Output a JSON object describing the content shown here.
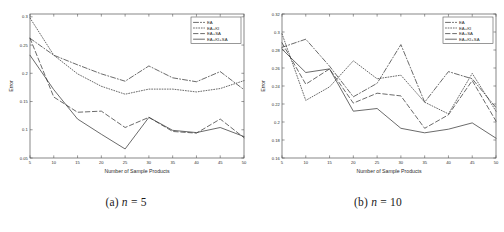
{
  "figure": {
    "subfigures": [
      {
        "caption_prefix": "(a)",
        "caption_var": "n",
        "caption_eq": "=",
        "caption_value": "5",
        "caption_full": "(a) n = 5"
      },
      {
        "caption_prefix": "(b)",
        "caption_var": "n",
        "caption_eq": "=",
        "caption_value": "10",
        "caption_full": "(b) n = 10"
      }
    ]
  },
  "chart_data": [
    {
      "type": "line",
      "title": "",
      "xlabel": "Number of Sample Products",
      "ylabel": "Error",
      "x": [
        5,
        10,
        15,
        20,
        25,
        30,
        35,
        40,
        45,
        50
      ],
      "xlim": [
        5,
        50
      ],
      "ylim": [
        0.05,
        0.305
      ],
      "xticks": [
        5,
        10,
        15,
        20,
        25,
        30,
        35,
        40,
        45,
        50
      ],
      "xticklabels": [
        "5",
        "10",
        "15",
        "20",
        "25",
        "30",
        "35",
        "40",
        "45",
        "50"
      ],
      "yticks": [
        0.05,
        0.1,
        0.15,
        0.2,
        0.25,
        0.3
      ],
      "yticklabels": [
        "0.05",
        "0.1",
        "0.15",
        "0.2",
        "0.25",
        "0.3"
      ],
      "grid": false,
      "legend_position": "upper right",
      "series": [
        {
          "name": "EA",
          "style": "dashdot",
          "values": [
            0.262,
            0.232,
            0.215,
            0.199,
            0.186,
            0.213,
            0.192,
            0.185,
            0.203,
            0.171
          ]
        },
        {
          "name": "EA+KI",
          "style": "dotted",
          "values": [
            0.298,
            0.232,
            0.199,
            0.177,
            0.163,
            0.172,
            0.172,
            0.167,
            0.173,
            0.187
          ]
        },
        {
          "name": "EA+SA",
          "style": "dashed",
          "values": [
            0.262,
            0.158,
            0.131,
            0.133,
            0.104,
            0.122,
            0.097,
            0.094,
            0.119,
            0.086
          ]
        },
        {
          "name": "EA+KI+SA",
          "style": "solid",
          "values": [
            0.232,
            0.171,
            0.119,
            0.092,
            0.066,
            0.122,
            0.099,
            0.095,
            0.104,
            0.088
          ]
        }
      ]
    },
    {
      "type": "line",
      "title": "",
      "xlabel": "Number of Sample Products",
      "ylabel": "Error",
      "x": [
        5,
        10,
        15,
        20,
        25,
        30,
        35,
        40,
        45,
        50
      ],
      "xlim": [
        5,
        50
      ],
      "ylim": [
        0.16,
        0.32
      ],
      "xticks": [
        5,
        10,
        15,
        20,
        25,
        30,
        35,
        40,
        45,
        50
      ],
      "xticklabels": [
        "5",
        "10",
        "15",
        "20",
        "25",
        "30",
        "35",
        "40",
        "45",
        "50"
      ],
      "yticks": [
        0.16,
        0.18,
        0.2,
        0.22,
        0.24,
        0.26,
        0.28,
        0.3,
        0.32
      ],
      "yticklabels": [
        "0.16",
        "0.18",
        "0.2",
        "0.22",
        "0.24",
        "0.26",
        "0.28",
        "0.3",
        "0.32"
      ],
      "grid": false,
      "legend_position": "upper right",
      "series": [
        {
          "name": "EA",
          "style": "dashdot",
          "values": [
            0.283,
            0.292,
            0.262,
            0.228,
            0.243,
            0.286,
            0.222,
            0.256,
            0.248,
            0.216
          ]
        },
        {
          "name": "EA+KI",
          "style": "dotted",
          "values": [
            0.298,
            0.224,
            0.239,
            0.268,
            0.248,
            0.252,
            0.222,
            0.209,
            0.254,
            0.212
          ]
        },
        {
          "name": "EA+SA",
          "style": "dashed",
          "values": [
            0.288,
            0.242,
            0.259,
            0.221,
            0.232,
            0.229,
            0.193,
            0.208,
            0.246,
            0.201
          ]
        },
        {
          "name": "EA+KI+SA",
          "style": "solid",
          "values": [
            0.281,
            0.255,
            0.259,
            0.212,
            0.215,
            0.193,
            0.188,
            0.192,
            0.199,
            0.182
          ]
        }
      ]
    }
  ]
}
